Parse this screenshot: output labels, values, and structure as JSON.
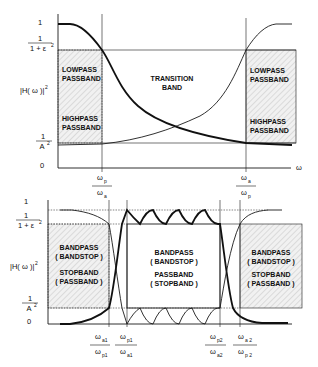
{
  "top_chart": {
    "y_ticks": {
      "one": "1",
      "eps_num": "1",
      "eps_den": "1 + ε",
      "eps_sup": "2",
      "a_num": "1",
      "a_den": "A",
      "a_sup": "2",
      "zero": "0"
    },
    "y_label": "|H( ω )|",
    "y_label_sup": "2",
    "x_axis_label": "ω",
    "x_ticks": [
      {
        "num": "ω",
        "num_sub": "p",
        "den": "ω",
        "den_sub": "a"
      },
      {
        "num": "ω",
        "num_sub": "a",
        "den": "ω",
        "den_sub": "p"
      }
    ],
    "left_box": {
      "line1": "LOWPASS",
      "line2": "PASSBAND",
      "line3": "HIGHPASS",
      "line4": "PASSBAND"
    },
    "middle": {
      "line1": "TRANSITION",
      "line2": "BAND"
    },
    "right_box": {
      "line1": "LOWPASS",
      "line2": "PASSBAND",
      "line3": "HIGHPASS",
      "line4": "PASSBAND"
    }
  },
  "bottom_chart": {
    "y_ticks": {
      "one": "1",
      "eps_num": "1",
      "eps_den": "1 + ε",
      "eps_sup": "2",
      "a_num": "1",
      "a_den": "A",
      "a_sup": "2",
      "zero": "0"
    },
    "y_label": "|H( ω )|",
    "y_label_sup": "2",
    "x_ticks": [
      {
        "num": "ω",
        "num_sub": "a1",
        "den": "ω",
        "den_sub": "p1"
      },
      {
        "num": "ω",
        "num_sub": "p1",
        "den": "ω",
        "den_sub": "a1"
      },
      {
        "num": "ω",
        "num_sub": "p2",
        "den": "ω",
        "den_sub": "a2"
      },
      {
        "num": "ω",
        "num_sub": "a 2",
        "den": "ω",
        "den_sub": "p 2"
      }
    ],
    "left_box": {
      "line1": "BANDPASS",
      "line2": "( BANDSTOP )",
      "line3": "STOPBAND",
      "line4": "( PASSBAND )"
    },
    "middle": {
      "line1": "BANDPASS",
      "line2": "( BANDSTOP )",
      "line3": "PASSBAND",
      "line4": "( STOPBAND )"
    },
    "right_box": {
      "line1": "BANDPASS",
      "line2": "( BANDSTOP )",
      "line3": "STOPBAND",
      "line4": "( PASSBAND )"
    }
  }
}
